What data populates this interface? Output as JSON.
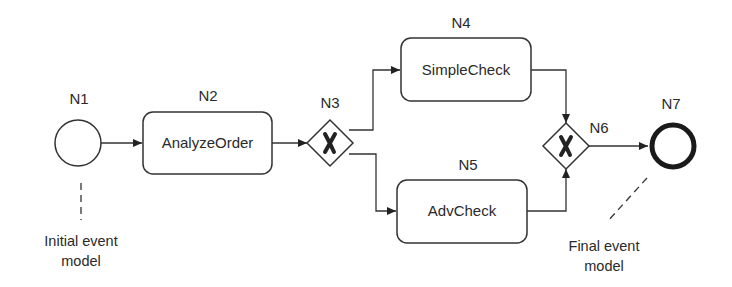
{
  "nodes": {
    "n1": {
      "id": "N1",
      "type": "start-event"
    },
    "n2": {
      "id": "N2",
      "type": "task",
      "label": "AnalyzeOrder"
    },
    "n3": {
      "id": "N3",
      "type": "exclusive-gateway",
      "symbol": "X"
    },
    "n4": {
      "id": "N4",
      "type": "task",
      "label": "SimpleCheck"
    },
    "n5": {
      "id": "N5",
      "type": "task",
      "label": "AdvCheck"
    },
    "n6": {
      "id": "N6",
      "type": "exclusive-gateway",
      "symbol": "X"
    },
    "n7": {
      "id": "N7",
      "type": "end-event"
    }
  },
  "edges": [
    {
      "from": "N1",
      "to": "N2"
    },
    {
      "from": "N2",
      "to": "N3"
    },
    {
      "from": "N3",
      "to": "N4"
    },
    {
      "from": "N3",
      "to": "N5"
    },
    {
      "from": "N4",
      "to": "N6"
    },
    {
      "from": "N5",
      "to": "N6"
    },
    {
      "from": "N6",
      "to": "N7"
    }
  ],
  "annotations": {
    "initial": {
      "line1": "Initial event",
      "line2": "model"
    },
    "final": {
      "line1": "Final event",
      "line2": "model"
    }
  }
}
